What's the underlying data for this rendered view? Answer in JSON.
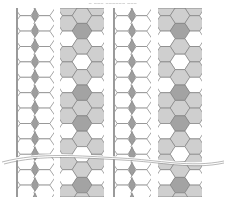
{
  "title": "‒ ‒‒‒ ‒‒‒‒‒‒ ‒‒‒",
  "colors": {
    "stroke": "#7f7f7f",
    "white": "#ffffff",
    "light": "#cfcfcf",
    "dark": "#a3a3a3",
    "diamond": "#9e9e9e",
    "edge": "#9a9a9a",
    "break_line": "#8a8a8a"
  },
  "strips": [
    {
      "kind": "diamond",
      "x": 16,
      "width": 38
    },
    {
      "kind": "shaded",
      "x": 60,
      "width": 44
    },
    {
      "kind": "diamond",
      "x": 113,
      "width": 38
    },
    {
      "kind": "shaded",
      "x": 158,
      "width": 44
    }
  ],
  "layout": {
    "top": 8,
    "bottom": 197,
    "row_height": 15.4
  },
  "shaded_pattern": {
    "period_rows": 6,
    "center": [
      "light",
      "dark",
      "light",
      "white",
      "light",
      "dark"
    ],
    "sides": [
      "light",
      "light",
      "white",
      "light",
      "light",
      "white"
    ]
  },
  "break_line": {
    "y": 160,
    "label": "break"
  }
}
